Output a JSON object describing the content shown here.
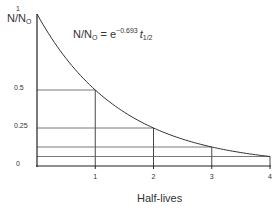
{
  "chart_data": {
    "type": "line",
    "title": "",
    "formula": {
      "lhs_main": "N/N",
      "lhs_sub": "O",
      "equals": " = e",
      "exponent": "−0.693",
      "t": "t",
      "t_sub": "1/2"
    },
    "xlabel": "Half-lives",
    "ylabel": {
      "main": "N/N",
      "sub": "O"
    },
    "x_ticks": [
      "1",
      "2",
      "3",
      "4"
    ],
    "y_ticks": [
      {
        "value": 1,
        "label": "1"
      },
      {
        "value": 0.5,
        "label": "0.5"
      },
      {
        "value": 0.25,
        "label": "0.25"
      },
      {
        "value": 0,
        "label": "0"
      }
    ],
    "xlim": [
      0,
      4
    ],
    "ylim": [
      0,
      1
    ],
    "series": [
      {
        "name": "N/No",
        "x": [
          0,
          0.5,
          1,
          1.5,
          2,
          2.5,
          3,
          3.5,
          4
        ],
        "values": [
          1,
          0.707,
          0.5,
          0.354,
          0.25,
          0.177,
          0.125,
          0.088,
          0.0625
        ]
      }
    ],
    "guide_points": [
      {
        "x": 1,
        "y": 0.5
      },
      {
        "x": 2,
        "y": 0.25
      },
      {
        "x": 3,
        "y": 0.125
      },
      {
        "x": 4,
        "y": 0.0625
      }
    ],
    "grid": false,
    "legend": "none"
  }
}
